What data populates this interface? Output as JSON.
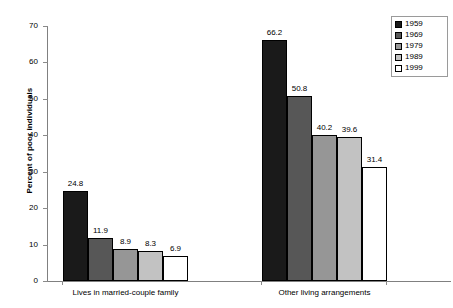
{
  "chart_data": {
    "type": "bar",
    "title": "",
    "subtitle": "",
    "xlabel": "",
    "ylabel": "Percent of poor individuals",
    "ylim": [
      0,
      70
    ],
    "y_ticks": [
      0,
      10,
      20,
      30,
      40,
      50,
      60,
      70
    ],
    "grid": false,
    "legend_position": "top-right",
    "categories": [
      "Lives in married-couple family",
      "Other living arrangements"
    ],
    "series": [
      {
        "name": "1959",
        "color": "#1a1a1a",
        "values": [
          24.8,
          66.2
        ],
        "labels": [
          "24.8",
          "66.2"
        ]
      },
      {
        "name": "1969",
        "color": "#575757",
        "values": [
          11.9,
          50.8
        ],
        "labels": [
          "11.9",
          "50.8"
        ]
      },
      {
        "name": "1979",
        "color": "#969696",
        "values": [
          8.9,
          40.2
        ],
        "labels": [
          "8.9",
          "40.2"
        ]
      },
      {
        "name": "1989",
        "color": "#c2c2c2",
        "values": [
          8.3,
          39.6
        ],
        "labels": [
          "8.3",
          "39.6"
        ]
      },
      {
        "name": "1999",
        "color": "#ffffff",
        "values": [
          6.9,
          31.4
        ],
        "labels": [
          "6.9",
          "31.4"
        ]
      }
    ]
  },
  "axis": {
    "y_tick_labels": [
      "0",
      "10",
      "20",
      "30",
      "40",
      "50",
      "60",
      "70"
    ],
    "y_title": "Percent of poor individuals"
  },
  "legend": {
    "entries": [
      {
        "label": "1959"
      },
      {
        "label": "1969"
      },
      {
        "label": "1979"
      },
      {
        "label": "1989"
      },
      {
        "label": "1999"
      }
    ]
  }
}
